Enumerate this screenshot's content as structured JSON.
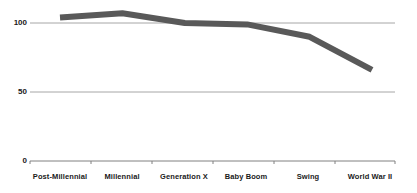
{
  "chart_data": {
    "type": "line",
    "title": "",
    "subtitle": "",
    "xlabel": "",
    "ylabel": "",
    "categories": [
      "Post-Millennial",
      "Millennial",
      "Generation X",
      "Baby Boom",
      "Swing",
      "World War II"
    ],
    "series": [
      {
        "name": "",
        "values": [
          104,
          107,
          100,
          99,
          90,
          66
        ]
      }
    ],
    "ylim": [
      0,
      115
    ],
    "yticks": [
      0,
      50,
      100
    ],
    "ytick_labels": [
      "0",
      "50",
      "100"
    ],
    "grid": true,
    "grid_lines_at": [
      50,
      100
    ],
    "legend": false,
    "legend_position": "none",
    "line_color": "#595959",
    "line_width_px": 6,
    "grid_color": "#a6a6a6",
    "axis_color": "#808080",
    "text_color": "#1a1a1a",
    "background": "#ffffff",
    "markers": false,
    "annotations": []
  },
  "layout": {
    "plot_left_px": 30,
    "plot_right_px": 395,
    "baseline_y_px": 161,
    "y100_px": 23,
    "y50_px": 92,
    "first_point_x_px": 60,
    "last_point_x_px": 372
  }
}
